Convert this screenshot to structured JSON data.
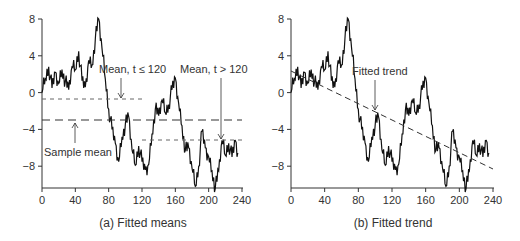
{
  "chart_data": [
    {
      "type": "line",
      "title": "(a) Fitted means",
      "xlabel": "",
      "ylabel": "",
      "xlim": [
        0,
        240
      ],
      "ylim": [
        -10.5,
        8
      ],
      "xticks": [
        0,
        40,
        80,
        120,
        160,
        200,
        240
      ],
      "yticks": [
        8,
        4,
        0,
        -4,
        -8
      ],
      "grid": false,
      "series": [
        {
          "name": "Series",
          "style": "solid"
        },
        {
          "name": "Sample mean",
          "style": "long-dash",
          "x": [
            0,
            240
          ],
          "y": [
            -3.1,
            -3.1
          ]
        },
        {
          "name": "Mean, t ≤ 120",
          "style": "short-dash",
          "x": [
            0,
            120
          ],
          "y": [
            -0.7,
            -0.7
          ]
        },
        {
          "name": "Mean, t > 120",
          "style": "short-dash",
          "x": [
            120,
            240
          ],
          "y": [
            -5.3,
            -5.3
          ]
        }
      ],
      "annotations": [
        {
          "text": "Mean, t ≤ 120",
          "arrow_to": [
            96,
            -0.7
          ]
        },
        {
          "text": "Mean, t > 120",
          "arrow_to": [
            216,
            -5.3
          ]
        },
        {
          "text": "Sample mean",
          "arrow_to": [
            40,
            -3.1
          ]
        }
      ]
    },
    {
      "type": "line",
      "title": "(b) Fitted trend",
      "xlabel": "",
      "ylabel": "",
      "xlim": [
        0,
        240
      ],
      "ylim": [
        -10.5,
        8
      ],
      "xticks": [
        0,
        40,
        80,
        120,
        160,
        200,
        240
      ],
      "yticks": [
        8,
        4,
        0,
        -4,
        -8
      ],
      "grid": false,
      "series": [
        {
          "name": "Series",
          "style": "solid"
        },
        {
          "name": "Fitted trend",
          "style": "dashed",
          "x": [
            0,
            240
          ],
          "y": [
            2.3,
            -8.3
          ]
        }
      ],
      "annotations": [
        {
          "text": "Fitted trend",
          "arrow_to": [
            100,
            -2.0
          ]
        }
      ]
    }
  ],
  "series_points": {
    "x": [
      0,
      4,
      8,
      12,
      16,
      20,
      24,
      28,
      32,
      36,
      40,
      44,
      48,
      52,
      56,
      60,
      64,
      68,
      72,
      76,
      80,
      84,
      88,
      92,
      96,
      100,
      104,
      108,
      112,
      116,
      120,
      124,
      128,
      132,
      136,
      140,
      144,
      148,
      152,
      156,
      160,
      164,
      168,
      172,
      176,
      180,
      184,
      188,
      192,
      196,
      200,
      204,
      208,
      212,
      216,
      220,
      224,
      228,
      232,
      236,
      240
    ],
    "y": [
      0,
      1.5,
      2.8,
      0.5,
      2.2,
      1,
      2.5,
      1.2,
      0.3,
      2.8,
      2.5,
      4.5,
      1.3,
      0.6,
      3.5,
      3,
      5.8,
      8,
      4.8,
      1.5,
      -1.8,
      -4,
      -5.5,
      -7.5,
      -4.8,
      -3.5,
      -2.6,
      -6.2,
      -7.9,
      -5.8,
      -7.5,
      -8.4,
      -7.8,
      -4.5,
      -1.8,
      -2.5,
      -0.8,
      -2.2,
      -1.3,
      0.3,
      1.6,
      -1.2,
      -3.6,
      -6.3,
      -6.0,
      -8.2,
      -10.2,
      -8.0,
      -4.2,
      -6.0,
      -7.0,
      -8.5,
      -10.4,
      -8.5,
      -5.2,
      -6.8,
      -5.5,
      -7.0,
      -5.2,
      -7.0
    ]
  },
  "axis_labels": {
    "x": [
      "0",
      "40",
      "80",
      "120",
      "160",
      "200",
      "240"
    ],
    "y": [
      "8",
      "4",
      "0",
      "−4",
      "−8"
    ]
  },
  "panel_a": {
    "caption": "(a) Fitted means",
    "ann_mean_le": "Mean, t ≤ 120",
    "ann_mean_gt": "Mean, t > 120",
    "ann_sample": "Sample mean"
  },
  "panel_b": {
    "caption": "(b) Fitted trend",
    "ann_trend": "Fitted trend"
  }
}
